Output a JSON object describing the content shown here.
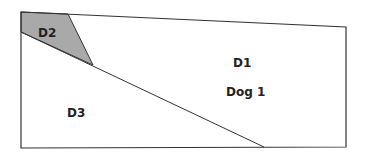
{
  "diagram": {
    "regions": [
      {
        "id": "D1",
        "label": "D1",
        "sublabel": "Dog 1",
        "fill": "#ffffff"
      },
      {
        "id": "D2",
        "label": "D2",
        "fill": "#a9a9a9"
      },
      {
        "id": "D3",
        "label": "D3",
        "fill": "#ffffff"
      }
    ],
    "stroke_color": "#333333"
  }
}
